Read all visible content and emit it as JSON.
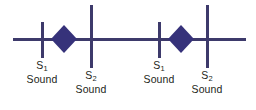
{
  "figure": {
    "type": "timeline-diagram",
    "width": 256,
    "height": 110,
    "background_color": "#ffffff",
    "stroke_color": "#3d3a6b",
    "diamond_fill_color": "#36327a",
    "text_color": "#231f20"
  },
  "axis": {
    "name": "time-axis",
    "x_start": 13,
    "x_end": 246,
    "y": 39,
    "thickness": 3
  },
  "events": [
    {
      "id": "event-1",
      "symbol": "S",
      "subscript": "1",
      "word": "Sound",
      "tick_x": 42,
      "tick_top": 22,
      "tick_bottom": 58,
      "tick_height": "short",
      "label_x": 42,
      "label_y": 60
    },
    {
      "id": "event-2",
      "symbol": "S",
      "subscript": "2",
      "word": "Sound",
      "tick_x": 91,
      "tick_top": 5,
      "tick_bottom": 68,
      "tick_height": "tall",
      "label_x": 91,
      "label_y": 70
    },
    {
      "id": "event-3",
      "symbol": "S",
      "subscript": "1",
      "word": "Sound",
      "tick_x": 159,
      "tick_top": 22,
      "tick_bottom": 58,
      "tick_height": "short",
      "label_x": 159,
      "label_y": 60
    },
    {
      "id": "event-4",
      "symbol": "S",
      "subscript": "2",
      "word": "Sound",
      "tick_x": 207,
      "tick_top": 5,
      "tick_bottom": 68,
      "tick_height": "tall",
      "label_x": 207,
      "label_y": 70
    }
  ],
  "murmurs": [
    {
      "id": "murmur-1",
      "shape": "diamond",
      "center_x": 64,
      "center_y": 39,
      "half_width": 13,
      "half_height": 14
    },
    {
      "id": "murmur-2",
      "shape": "diamond",
      "center_x": 181,
      "center_y": 39,
      "half_width": 13,
      "half_height": 14
    }
  ]
}
